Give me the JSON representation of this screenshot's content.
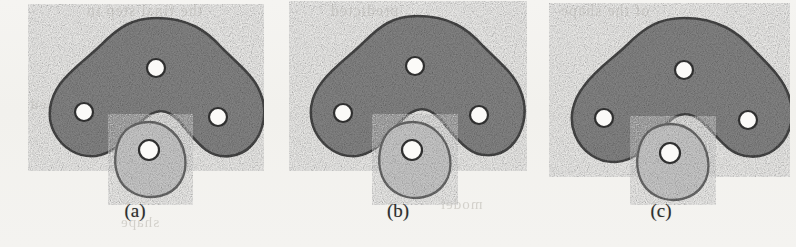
{
  "figure": {
    "background_color": "#f3f2ef",
    "body_fill": "#8a8a8a",
    "body_stroke": "#4a4a4a",
    "sub_fill": "#d2d2d2",
    "sub_stroke": "#6e6e6e",
    "hole_fill": "#fbfaf8",
    "hole_stroke": "#2f2f2f",
    "caption_color": "#2e2e2e"
  },
  "bleed_text": [
    {
      "text": "the final step in",
      "x": 86,
      "y": 2,
      "size": 16
    },
    {
      "text": "predicted",
      "x": 330,
      "y": 2,
      "size": 16
    },
    {
      "text": "of the shape",
      "x": 560,
      "y": 2,
      "size": 16
    },
    {
      "text": "a closed",
      "x": 30,
      "y": 96,
      "size": 15
    },
    {
      "text": "contour",
      "x": 200,
      "y": 128,
      "size": 15
    },
    {
      "text": "region",
      "x": 600,
      "y": 110,
      "size": 15
    },
    {
      "text": "model",
      "x": 440,
      "y": 196,
      "size": 15
    },
    {
      "text": "shape",
      "x": 120,
      "y": 214,
      "size": 15
    }
  ],
  "panels": [
    {
      "id": "panel-a",
      "caption": "(a)",
      "body_label": "cam-body-outline",
      "sub_label": "light-oval-shape",
      "holes": [
        {
          "name": "top-hole",
          "cx": 150,
          "cy": 68,
          "r": 9
        },
        {
          "name": "left-hole",
          "cx": 78,
          "cy": 112,
          "r": 9
        },
        {
          "name": "right-hole",
          "cx": 212,
          "cy": 117,
          "r": 9
        }
      ],
      "sub_hole": {
        "name": "oval-hole",
        "cx": 143,
        "cy": 150,
        "r": 10
      },
      "body_path": "M150 18 C182 18 200 30 216 48 C232 64 248 76 254 92 C262 110 258 132 246 145 C234 158 214 160 200 150 C188 141 180 128 172 120 C164 112 156 110 150 112 C142 114 134 122 126 132 C116 144 104 154 90 156 C72 158 56 148 48 132 C40 116 44 98 54 84 C66 68 82 58 96 44 C112 28 126 18 150 18 Z",
      "sub_path": "M143 122 C160 122 176 136 179 156 C182 176 172 192 154 196 C136 200 118 192 112 176 C106 160 110 140 120 130 C127 124 135 122 143 122 Z"
    },
    {
      "id": "panel-b",
      "caption": "(b)",
      "body_label": "cam-body-outline",
      "sub_label": "light-oval-shape",
      "holes": [
        {
          "name": "top-hole",
          "cx": 146,
          "cy": 66,
          "r": 9
        },
        {
          "name": "left-hole",
          "cx": 74,
          "cy": 113,
          "r": 9
        },
        {
          "name": "right-hole",
          "cx": 210,
          "cy": 115,
          "r": 9
        }
      ],
      "sub_hole": {
        "name": "oval-hole",
        "cx": 143,
        "cy": 150,
        "r": 10
      },
      "body_path": "M148 16 C180 16 198 28 214 46 C230 62 246 74 252 92 C260 112 254 134 242 146 C230 158 210 158 198 148 C186 139 178 126 170 118 C162 110 154 108 148 110 C140 112 132 120 124 131 C114 144 102 154 88 156 C70 158 54 147 46 131 C38 114 42 96 53 82 C65 66 81 56 95 42 C111 26 124 16 148 16 Z",
      "sub_path": "M144 122 C162 122 178 137 181 157 C184 177 173 193 155 197 C137 201 119 192 113 176 C107 160 111 140 121 130 C128 124 136 122 144 122 Z"
    },
    {
      "id": "panel-c",
      "caption": "(c)",
      "body_label": "cam-body-outline",
      "sub_label": "light-oval-shape",
      "holes": [
        {
          "name": "top-hole",
          "cx": 152,
          "cy": 70,
          "r": 9
        },
        {
          "name": "left-hole",
          "cx": 72,
          "cy": 118,
          "r": 9
        },
        {
          "name": "right-hole",
          "cx": 216,
          "cy": 120,
          "r": 9
        }
      ],
      "sub_hole": {
        "name": "oval-hole",
        "cx": 138,
        "cy": 153,
        "r": 10
      },
      "body_path": "M152 18 C186 18 206 32 222 50 C240 68 254 82 258 100 C264 120 256 140 242 150 C228 160 208 158 196 148 C184 138 176 126 168 120 C160 114 152 113 145 116 C136 120 128 130 120 141 C110 153 98 161 84 162 C66 163 50 152 43 135 C36 118 41 100 52 86 C65 68 82 58 96 44 C113 27 128 18 152 18 Z",
      "sub_path": "M139 124 C157 124 173 139 176 159 C179 179 168 195 150 199 C132 203 114 194 108 178 C102 162 106 142 116 132 C123 126 131 124 139 124 Z"
    }
  ]
}
